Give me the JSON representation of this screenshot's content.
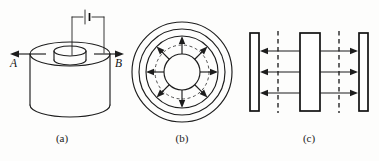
{
  "figure": {
    "background_color": "#fdfdfc",
    "ink_color": "#1d1d1d",
    "panels": [
      {
        "id": "a",
        "caption": "(a)",
        "description": "Cylinder with coaxial inner electrode connected to a battery",
        "labels": {
          "left_terminal": "A",
          "right_terminal": "B"
        },
        "components": {
          "battery": "battery-symbol",
          "outer_cylinder": "outer-cylinder",
          "inner_cylinder": "inner-cylinder",
          "left_arrow": "arrow-left",
          "right_arrow": "arrow-right"
        }
      },
      {
        "id": "b",
        "caption": "(b)",
        "description": "End-on cross-section with eight radial field arrows",
        "ring_count": 2,
        "radial_arrow_count": 8,
        "dashed_circle": "mid-dashed-circle"
      },
      {
        "id": "c",
        "caption": "(c)",
        "description": "Equivalent parallel plates with outward field arrows",
        "plate_count": 3,
        "dashed_line_count": 2,
        "arrow_rows": 3,
        "left_gap_arrow_direction": "left",
        "right_gap_arrow_direction": "right"
      }
    ],
    "captions": {
      "a": "(a)",
      "b": "(b)",
      "c": "(c)"
    }
  }
}
